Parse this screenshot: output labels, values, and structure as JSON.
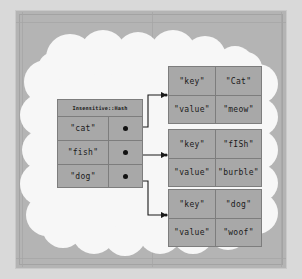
{
  "diagram": {
    "title": "Insensitive::Hash",
    "hash_table": {
      "title": "Insensitive::Hash",
      "entries": [
        {
          "key": "\"cat\"",
          "pointer": "pointer-dot"
        },
        {
          "key": "\"fish\"",
          "pointer": "pointer-dot"
        },
        {
          "key": "\"dog\"",
          "pointer": "pointer-dot"
        }
      ]
    },
    "records": [
      {
        "rows": [
          {
            "label": "\"key\"",
            "value": "\"Cat\""
          },
          {
            "label": "\"value\"",
            "value": "\"meow\""
          }
        ]
      },
      {
        "rows": [
          {
            "label": "\"key\"",
            "value": "\"fISh\""
          },
          {
            "label": "\"value\"",
            "value": "\"burble\""
          }
        ]
      },
      {
        "rows": [
          {
            "label": "\"key\"",
            "value": "\"dog\""
          },
          {
            "label": "\"value\"",
            "value": "\"woof\""
          }
        ]
      }
    ],
    "colors": {
      "page_background": "#d9d9d9",
      "frame": "#b4b4b4",
      "cloud": "#f7f7f7",
      "cell_fill": "#a8a8a8",
      "cell_border": "#7d7d7d",
      "text": "#1a1a1a",
      "connector": "#1a1a1a"
    }
  }
}
